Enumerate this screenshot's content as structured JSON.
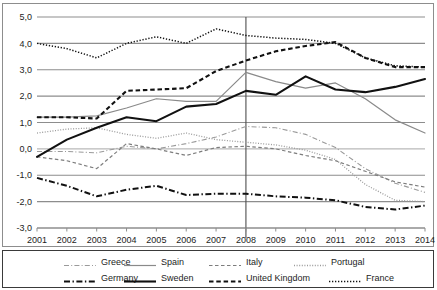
{
  "chart_data": {
    "type": "line",
    "title": "",
    "subtitle": "",
    "xlabel": "",
    "ylabel": "",
    "x": [
      2001,
      2002,
      2003,
      2004,
      2005,
      2006,
      2007,
      2008,
      2009,
      2010,
      2011,
      2012,
      2013,
      2014
    ],
    "xlim": [
      2001,
      2014
    ],
    "ylim": [
      -3.0,
      5.0
    ],
    "ytick_labels": [
      "5,0",
      "4,0",
      "3,0",
      "2,0",
      "1,0",
      "0,0",
      "-1,0",
      "-2,0",
      "-3,0"
    ],
    "ytick_values": [
      5.0,
      4.0,
      3.0,
      2.0,
      1.0,
      0.0,
      -1.0,
      -2.0,
      -3.0
    ],
    "xtick_labels": [
      "2001",
      "2002",
      "2003",
      "2004",
      "2005",
      "2006",
      "2007",
      "2008",
      "2009",
      "2010",
      "2011",
      "2012",
      "2013",
      "2014"
    ],
    "grid": "horizontal",
    "legend_position": "bottom",
    "annotations": [
      {
        "name": "vertical-reference-line",
        "x": 2008
      }
    ],
    "series": [
      {
        "name": "Greece",
        "style": "dash-dot",
        "color": "#9a9a9a",
        "width": 1.1,
        "values": [
          -0.1,
          -0.1,
          -0.15,
          0.1,
          0.0,
          0.2,
          0.45,
          0.85,
          0.8,
          0.55,
          0.05,
          -0.75,
          -1.3,
          -1.65
        ]
      },
      {
        "name": "Spain",
        "style": "solid",
        "color": "#8a8a8a",
        "width": 1.2,
        "values": [
          1.2,
          1.2,
          1.25,
          1.55,
          1.9,
          1.8,
          1.8,
          2.9,
          2.55,
          2.3,
          2.5,
          1.9,
          1.1,
          0.6
        ]
      },
      {
        "name": "Italy",
        "style": "dashed",
        "color": "#7d7d7d",
        "width": 1.2,
        "values": [
          -0.3,
          -0.45,
          -0.75,
          0.2,
          0.0,
          -0.25,
          0.05,
          0.1,
          0.0,
          -0.25,
          -0.45,
          -0.85,
          -1.25,
          -1.45
        ]
      },
      {
        "name": "Portugal",
        "style": "dotted",
        "color": "#9a9a9a",
        "width": 1.3,
        "values": [
          0.6,
          0.75,
          0.8,
          0.55,
          0.4,
          0.6,
          0.35,
          0.25,
          0.15,
          -0.05,
          -0.4,
          -1.35,
          -1.95,
          -2.0
        ]
      },
      {
        "name": "Germany",
        "style": "dash-dot",
        "color": "#111111",
        "width": 2.0,
        "values": [
          -1.1,
          -1.4,
          -1.8,
          -1.55,
          -1.4,
          -1.75,
          -1.7,
          -1.7,
          -1.8,
          -1.85,
          -1.95,
          -2.2,
          -2.3,
          -2.15
        ]
      },
      {
        "name": "Sweden",
        "style": "solid",
        "color": "#111111",
        "width": 2.1,
        "values": [
          -0.3,
          0.35,
          0.8,
          1.2,
          1.05,
          1.6,
          1.7,
          2.2,
          2.05,
          2.75,
          2.25,
          2.15,
          2.35,
          2.65
        ]
      },
      {
        "name": "United Kingdom",
        "style": "dashed",
        "color": "#111111",
        "width": 2.1,
        "values": [
          1.2,
          1.2,
          1.15,
          2.2,
          2.25,
          2.3,
          2.95,
          3.35,
          3.7,
          3.9,
          4.05,
          3.45,
          3.1,
          3.1
        ]
      },
      {
        "name": "France",
        "style": "dotted",
        "color": "#111111",
        "width": 1.5,
        "values": [
          4.0,
          3.8,
          3.45,
          4.0,
          4.25,
          4.0,
          4.55,
          4.3,
          4.2,
          4.15,
          4.0,
          3.45,
          3.15,
          3.1
        ]
      }
    ]
  },
  "legend": {
    "rows": [
      [
        {
          "label": "Greece",
          "series": "Greece"
        },
        {
          "label": "Spain",
          "series": "Spain"
        },
        {
          "label": "Italy",
          "series": "Italy"
        },
        {
          "label": "Portugal",
          "series": "Portugal"
        }
      ],
      [
        {
          "label": "Germany",
          "series": "Germany"
        },
        {
          "label": "Sweden",
          "series": "Sweden"
        },
        {
          "label": "United Kingdom",
          "series": "United Kingdom"
        },
        {
          "label": "France",
          "series": "France"
        }
      ]
    ]
  },
  "style": {
    "grid_color": "#8d8d8d",
    "zero_line_color": "#b9b9b9",
    "frame_color": "#8d8d8d",
    "legend_frame_color": "#3a3a3a",
    "background": "#ffffff",
    "text_color": "#1d1d1d"
  }
}
